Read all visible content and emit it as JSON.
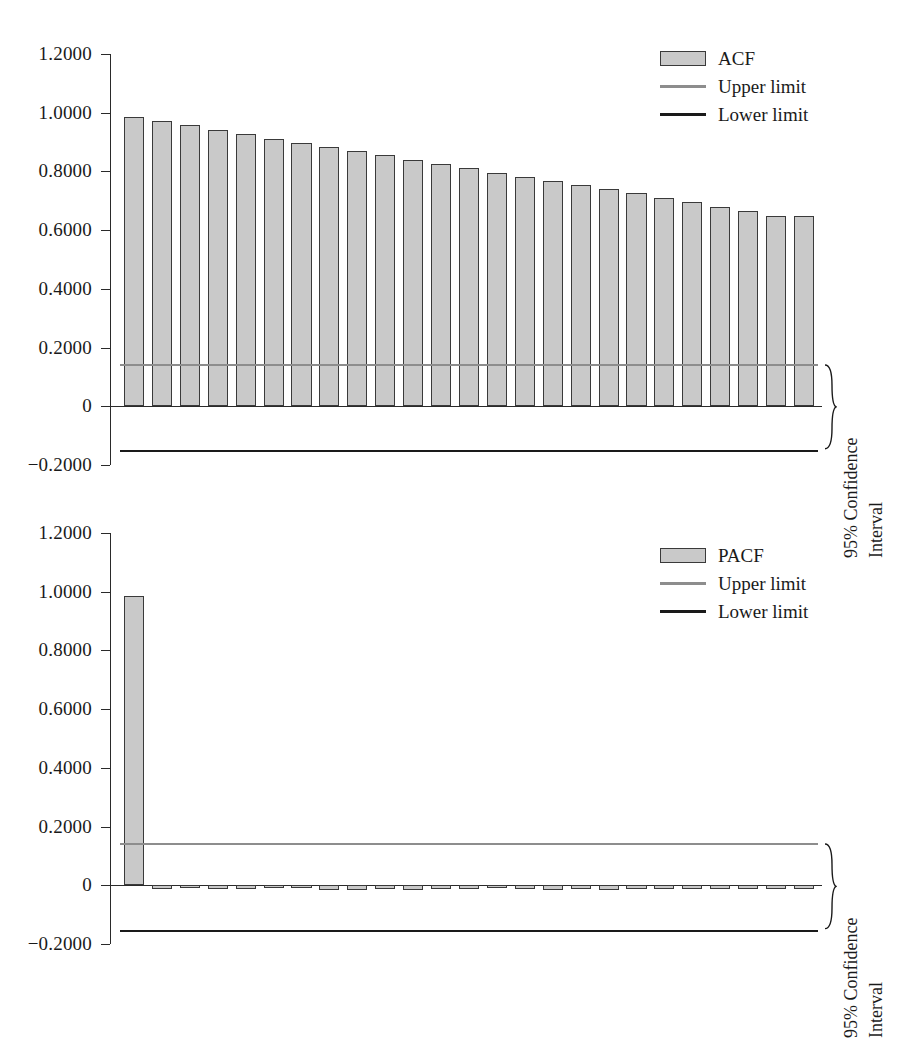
{
  "chart_data": [
    {
      "id": "acf",
      "type": "bar",
      "title": "",
      "xlabel": "",
      "ylabel": "",
      "ylim": [
        -0.2,
        1.2
      ],
      "ytick_labels": [
        "1.2000",
        "1.0000",
        "0.8000",
        "0.6000",
        "0.4000",
        "0.2000",
        "0",
        "−0.2000"
      ],
      "ytick_values": [
        1.2,
        1.0,
        0.8,
        0.6,
        0.4,
        0.2,
        0,
        -0.2
      ],
      "grid": false,
      "legend_position": "top-right",
      "series_name": "ACF",
      "categories": [
        1,
        2,
        3,
        4,
        5,
        6,
        7,
        8,
        9,
        10,
        11,
        12,
        13,
        14,
        15,
        16,
        17,
        18,
        19,
        20,
        21,
        22,
        23,
        24,
        25
      ],
      "values": [
        0.986,
        0.971,
        0.957,
        0.942,
        0.927,
        0.912,
        0.898,
        0.883,
        0.869,
        0.855,
        0.84,
        0.825,
        0.812,
        0.796,
        0.782,
        0.768,
        0.753,
        0.739,
        0.725,
        0.71,
        0.695,
        0.68,
        0.665,
        0.648,
        0.648
      ],
      "upper_limit": 0.143,
      "lower_limit": -0.149,
      "legend": [
        {
          "label": "ACF",
          "marker": "box",
          "color": "#c9c9c9"
        },
        {
          "label": "Upper limit",
          "marker": "line",
          "color": "#8d8d8d"
        },
        {
          "label": "Lower limit",
          "marker": "line",
          "color": "#1a1a1a"
        }
      ],
      "annotation": {
        "line1": "95% Confidence",
        "line2": "Interval"
      }
    },
    {
      "id": "pacf",
      "type": "bar",
      "title": "",
      "xlabel": "",
      "ylabel": "",
      "ylim": [
        -0.2,
        1.2
      ],
      "ytick_labels": [
        "1.2000",
        "1.0000",
        "0.8000",
        "0.6000",
        "0.4000",
        "0.2000",
        "0",
        "−0.2000"
      ],
      "ytick_values": [
        1.2,
        1.0,
        0.8,
        0.6,
        0.4,
        0.2,
        0,
        -0.2
      ],
      "grid": false,
      "legend_position": "top-right",
      "series_name": "PACF",
      "categories": [
        1,
        2,
        3,
        4,
        5,
        6,
        7,
        8,
        9,
        10,
        11,
        12,
        13,
        14,
        15,
        16,
        17,
        18,
        19,
        20,
        21,
        22,
        23,
        24,
        25
      ],
      "values": [
        0.986,
        -0.012,
        -0.01,
        -0.014,
        -0.013,
        -0.009,
        -0.01,
        -0.017,
        -0.015,
        -0.013,
        -0.016,
        -0.014,
        -0.011,
        -0.01,
        -0.013,
        -0.015,
        -0.012,
        -0.015,
        -0.011,
        -0.014,
        -0.013,
        -0.012,
        -0.014,
        -0.013,
        -0.012
      ],
      "upper_limit": 0.143,
      "lower_limit": -0.152,
      "legend": [
        {
          "label": "PACF",
          "marker": "box",
          "color": "#c9c9c9"
        },
        {
          "label": "Upper limit",
          "marker": "line",
          "color": "#8d8d8d"
        },
        {
          "label": "Lower limit",
          "marker": "line",
          "color": "#1a1a1a"
        }
      ],
      "annotation": {
        "line1": "95% Confidence",
        "line2": "Interval"
      }
    }
  ],
  "colors": {
    "bar_fill": "#c9c9c9",
    "bar_stroke": "#3a3a3a",
    "upper_limit": "#8d8d8d",
    "lower_limit": "#1a1a1a",
    "axis": "#2a2a2a",
    "background": "#ffffff"
  }
}
